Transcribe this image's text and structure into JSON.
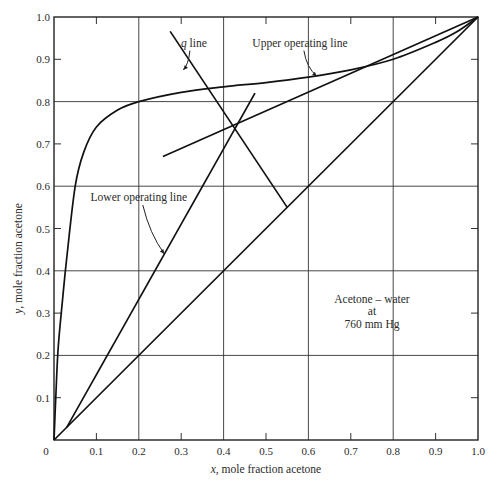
{
  "chart_data": {
    "type": "line",
    "title": "",
    "xlabel": "x, mole fraction acetone",
    "ylabel": "y, mole fraction acetone",
    "xlim": [
      0,
      1.0
    ],
    "ylim": [
      0,
      1.0
    ],
    "grid": true,
    "grid_major": [
      0.2,
      0.4,
      0.6,
      0.8
    ],
    "x_ticks": [
      "0.1",
      "0.2",
      "0.3",
      "0.4",
      "0.5",
      "0.6",
      "0.7",
      "0.8",
      "0.9",
      "1.0"
    ],
    "y_ticks": [
      "0.1",
      "0.2",
      "0.3",
      "0.4",
      "0.5",
      "0.6",
      "0.7",
      "0.8",
      "0.9",
      "1.0"
    ],
    "origin_label": "0",
    "series": [
      {
        "name": "Equilibrium curve",
        "x": [
          0,
          0.005,
          0.01,
          0.02,
          0.03,
          0.05,
          0.07,
          0.1,
          0.15,
          0.2,
          0.3,
          0.4,
          0.5,
          0.6,
          0.7,
          0.8,
          0.9,
          0.95,
          1.0
        ],
        "y": [
          0,
          0.12,
          0.22,
          0.33,
          0.43,
          0.6,
          0.68,
          0.74,
          0.78,
          0.8,
          0.822,
          0.835,
          0.845,
          0.858,
          0.875,
          0.9,
          0.94,
          0.965,
          1.0
        ]
      },
      {
        "name": "Diagonal (y = x)",
        "x": [
          0,
          1.0
        ],
        "y": [
          0,
          1.0
        ]
      },
      {
        "name": "Upper operating line",
        "x": [
          0.257,
          1.0
        ],
        "y": [
          0.67,
          1.0
        ]
      },
      {
        "name": "Lower operating line",
        "x": [
          0.03,
          0.474
        ],
        "y": [
          0.03,
          0.82
        ]
      },
      {
        "name": "q line",
        "x": [
          0.274,
          0.55
        ],
        "y": [
          0.966,
          0.55
        ]
      }
    ],
    "annotations": [
      {
        "text": "q line",
        "x": 0.33,
        "y": 0.93,
        "arrow_to": [
          0.305,
          0.875
        ]
      },
      {
        "text": "Upper operating line",
        "x": 0.58,
        "y": 0.93,
        "arrow_to": [
          0.62,
          0.86
        ]
      },
      {
        "text": "Lower operating line",
        "x": 0.2,
        "y": 0.565,
        "arrow_to": [
          0.26,
          0.44
        ]
      },
      {
        "text": "Acetone – water",
        "x": 0.75,
        "y": 0.325
      },
      {
        "text": "at",
        "x": 0.75,
        "y": 0.295
      },
      {
        "text": "760 mm Hg",
        "x": 0.75,
        "y": 0.265
      }
    ]
  },
  "plot": {
    "left": 54,
    "right": 478,
    "top": 17,
    "bottom": 440
  }
}
